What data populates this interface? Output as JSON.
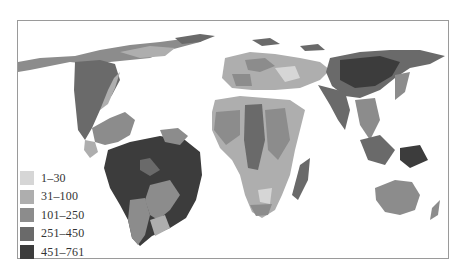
{
  "map": {
    "type": "choropleth cartogram (world)",
    "legend": {
      "items": [
        {
          "label": "1–30",
          "color": "#d6d6d6"
        },
        {
          "label": "31–100",
          "color": "#aeaeae"
        },
        {
          "label": "101–250",
          "color": "#8c8c8c"
        },
        {
          "label": "251–450",
          "color": "#6a6a6a"
        },
        {
          "label": "451–761",
          "color": "#3c3c3c"
        }
      ]
    }
  }
}
